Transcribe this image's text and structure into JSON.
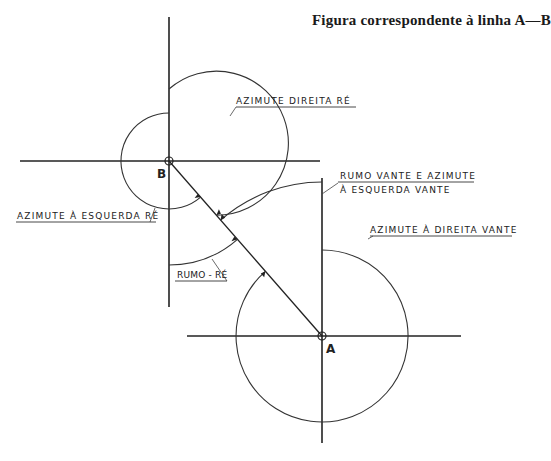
{
  "title": "Figura correspondente à linha A—B",
  "points": {
    "A": {
      "label": "A"
    },
    "B": {
      "label": "B"
    }
  },
  "labels": {
    "azimute_direita_re": "AZIMUTE  DIREITA  RÉ",
    "rumo_vante_line1": "RUMO VANTE  E  AZIMUTE",
    "rumo_vante_line2": "À  ESQUERDA  VANTE",
    "azimute_esquerda_re": "AZIMUTE  À  ESQUERDA  RÉ",
    "azimute_direita_vante": "AZIMUTE  À DIREITA  VANTE",
    "rumo_re": "RUMO - RÉ"
  },
  "colors": {
    "line": "#222222",
    "background": "#ffffff"
  }
}
